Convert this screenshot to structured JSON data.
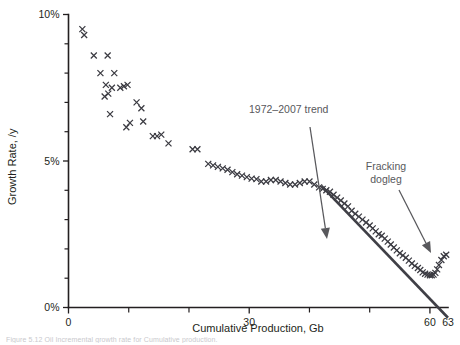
{
  "chart_data": {
    "type": "scatter",
    "title": "",
    "xlabel": "Cumulative Production, Gb",
    "ylabel": "Growth Rate, /y",
    "xlim": [
      0,
      63
    ],
    "ylim": [
      0,
      10
    ],
    "grid": false,
    "legend_position": "none",
    "x_ticks_major": [
      0,
      30,
      60
    ],
    "x_tick_labels": [
      "0",
      "30",
      "60",
      "63"
    ],
    "x_extra_tick_label": "63",
    "x_ticks_minor": [
      10,
      20,
      40,
      50
    ],
    "y_ticks_major": [
      0,
      5,
      10
    ],
    "y_tick_labels": [
      "0%",
      "5%",
      "10%"
    ],
    "y_ticks_minor": [
      1,
      2,
      3,
      4,
      6,
      7,
      8,
      9
    ],
    "marker": "x",
    "series": [
      {
        "name": "Growth rate vs cumulative production",
        "points": [
          [
            2.3,
            9.5
          ],
          [
            2.6,
            9.3
          ],
          [
            4.2,
            8.6
          ],
          [
            6.5,
            8.6
          ],
          [
            5.3,
            8.0
          ],
          [
            7.6,
            8.0
          ],
          [
            6.2,
            7.6
          ],
          [
            6.6,
            7.3
          ],
          [
            7.2,
            7.5
          ],
          [
            8.6,
            7.5
          ],
          [
            9.2,
            7.55
          ],
          [
            9.8,
            7.6
          ],
          [
            6.0,
            7.2
          ],
          [
            11.3,
            7.0
          ],
          [
            12.1,
            6.8
          ],
          [
            6.9,
            6.6
          ],
          [
            10.2,
            6.3
          ],
          [
            12.4,
            6.35
          ],
          [
            9.6,
            6.15
          ],
          [
            14.0,
            5.85
          ],
          [
            14.7,
            5.85
          ],
          [
            15.4,
            5.9
          ],
          [
            16.6,
            5.6
          ],
          [
            20.6,
            5.4
          ],
          [
            21.4,
            5.4
          ],
          [
            23.2,
            4.9
          ],
          [
            24.0,
            4.85
          ],
          [
            24.8,
            4.8
          ],
          [
            25.6,
            4.75
          ],
          [
            26.4,
            4.7
          ],
          [
            27.2,
            4.62
          ],
          [
            28.0,
            4.55
          ],
          [
            28.8,
            4.5
          ],
          [
            29.6,
            4.45
          ],
          [
            30.4,
            4.4
          ],
          [
            31.2,
            4.38
          ],
          [
            32.0,
            4.3
          ],
          [
            32.8,
            4.3
          ],
          [
            33.6,
            4.35
          ],
          [
            34.4,
            4.35
          ],
          [
            35.2,
            4.3
          ],
          [
            36.0,
            4.25
          ],
          [
            36.8,
            4.2
          ],
          [
            37.6,
            4.2
          ],
          [
            38.4,
            4.25
          ],
          [
            39.2,
            4.3
          ],
          [
            40.0,
            4.3
          ],
          [
            40.8,
            4.2
          ],
          [
            41.6,
            4.1
          ],
          [
            42.2,
            4.05
          ],
          [
            42.8,
            4.0
          ],
          [
            43.4,
            3.95
          ],
          [
            44.0,
            3.85
          ],
          [
            44.6,
            3.75
          ],
          [
            45.2,
            3.65
          ],
          [
            45.8,
            3.55
          ],
          [
            46.4,
            3.45
          ],
          [
            47.0,
            3.3
          ],
          [
            47.6,
            3.2
          ],
          [
            48.2,
            3.1
          ],
          [
            48.8,
            3.0
          ],
          [
            49.4,
            2.9
          ],
          [
            50.0,
            2.8
          ],
          [
            50.5,
            2.7
          ],
          [
            51.0,
            2.6
          ],
          [
            51.5,
            2.5
          ],
          [
            52.0,
            2.45
          ],
          [
            52.5,
            2.35
          ],
          [
            53.0,
            2.25
          ],
          [
            53.5,
            2.15
          ],
          [
            54.0,
            2.05
          ],
          [
            54.5,
            1.95
          ],
          [
            55.0,
            1.85
          ],
          [
            55.5,
            1.78
          ],
          [
            56.0,
            1.7
          ],
          [
            56.5,
            1.6
          ],
          [
            57.0,
            1.5
          ],
          [
            57.5,
            1.42
          ],
          [
            58.0,
            1.35
          ],
          [
            58.4,
            1.28
          ],
          [
            58.8,
            1.2
          ],
          [
            59.2,
            1.15
          ],
          [
            59.6,
            1.12
          ],
          [
            60.0,
            1.1
          ],
          [
            60.3,
            1.1
          ],
          [
            60.6,
            1.12
          ],
          [
            60.9,
            1.18
          ],
          [
            61.2,
            1.3
          ],
          [
            61.5,
            1.45
          ],
          [
            61.9,
            1.62
          ],
          [
            62.3,
            1.75
          ],
          [
            62.7,
            1.8
          ]
        ]
      }
    ],
    "trend_line": {
      "name": "1972-2007 trend",
      "x_start": 42.0,
      "y_start": 4.15,
      "x_end": 63.0,
      "y_end": -0.35
    },
    "annotations": [
      {
        "id": "trend-annotation",
        "label": "1972–2007 trend",
        "label_x": 249,
        "label_y": 113,
        "arrow_from": [
          310,
          127
        ],
        "arrow_to": [
          327,
          239
        ]
      },
      {
        "id": "fracking-annotation",
        "label_line1": "Fracking",
        "label_line2": "dogleg",
        "label_x": 386,
        "label_y": 170,
        "arrow_from": [
          399,
          190
        ],
        "arrow_to": [
          431,
          253
        ]
      }
    ]
  },
  "caption": {
    "text": "Figure 5.12  Oil Incremental growth rate for Cumulative production."
  },
  "colors": {
    "axis": "#231f20",
    "marker": "#3b3b42",
    "trend": "#3f3f46",
    "annotation": "#58585c",
    "background": "#ffffff"
  }
}
